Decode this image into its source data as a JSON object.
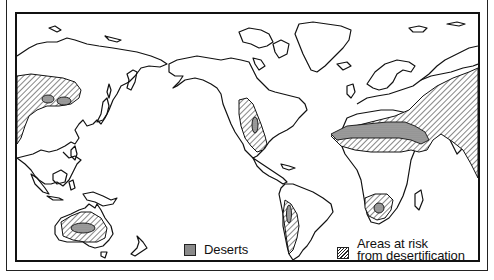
{
  "map": {
    "title": "",
    "projection": "Pacific-centered world map (line art)",
    "colors": {
      "outline": "#111111",
      "background": "#ffffff",
      "desert_fill": "#9a9a9a",
      "hatch": "#222222"
    },
    "regions": [
      {
        "name": "Central Asia",
        "category": "risk",
        "desert_patches": 2
      },
      {
        "name": "Western North America / Mexico",
        "category": "risk",
        "desert_patches": 1
      },
      {
        "name": "Western South America (Atacama / Patagonia)",
        "category": "risk",
        "desert_patches": 1
      },
      {
        "name": "North Africa / Sahara",
        "category": "desert"
      },
      {
        "name": "Sahel",
        "category": "risk"
      },
      {
        "name": "Middle East / Arabia / South-West Asia",
        "category": "risk"
      },
      {
        "name": "Southern Africa (Kalahari)",
        "category": "risk",
        "desert_patches": 1
      },
      {
        "name": "Australia",
        "category": "risk",
        "desert_patches": 1
      }
    ]
  },
  "legend": {
    "items": [
      {
        "key": "desert",
        "label": "Deserts"
      },
      {
        "key": "risk",
        "label_line1": "Areas at risk",
        "label_line2": "from desertification"
      }
    ]
  }
}
